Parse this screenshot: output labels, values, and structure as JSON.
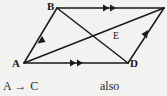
{
  "figure": {
    "name": "parallelogram-with-diagonals",
    "background_color": "#f2f2f0",
    "stroke_color": "#1a1a1a"
  },
  "vertices": {
    "A": {
      "label": "A",
      "x": 24,
      "y": 63
    },
    "B": {
      "label": "B",
      "x": 57,
      "y": 8
    },
    "C": {
      "label": "",
      "x": 164,
      "y": 8
    },
    "D": {
      "label": "D",
      "x": 128,
      "y": 63
    },
    "E": {
      "label": "E",
      "x": 110,
      "y": 37
    }
  },
  "edges": [
    {
      "name": "side-AB",
      "from": "A",
      "to": "B",
      "tick_marks": 1,
      "direction": "A-to-B"
    },
    {
      "name": "side-BC",
      "from": "B",
      "to": "C",
      "tick_marks": 2,
      "direction": "B-to-C"
    },
    {
      "name": "side-DC",
      "from": "D",
      "to": "C",
      "tick_marks": 1,
      "direction": "D-to-C"
    },
    {
      "name": "side-AD",
      "from": "A",
      "to": "D",
      "tick_marks": 2,
      "direction": "A-to-D"
    },
    {
      "name": "diagonal-AC",
      "from": "A",
      "to": "C",
      "tick_marks": 0,
      "direction": "none"
    },
    {
      "name": "diagonal-BD",
      "from": "B",
      "to": "D",
      "tick_marks": 0,
      "direction": "none"
    }
  ],
  "caption": {
    "left": "A → C",
    "right": "also"
  }
}
